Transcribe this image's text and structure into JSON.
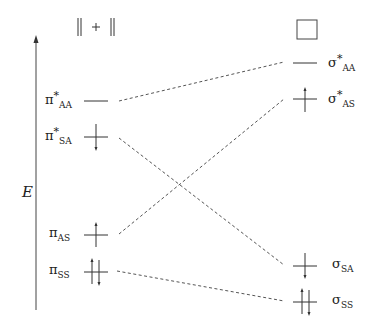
{
  "diagram": {
    "type": "molecular-orbital-correlation-diagram",
    "axis": {
      "label": "E",
      "direction": "up"
    },
    "left_header": {
      "symbol": "∥ + ∥"
    },
    "right_header": {
      "symbol": "□"
    },
    "left_levels": [
      {
        "id": "pi_star_AA",
        "base": "π",
        "star": "*",
        "sub": "AA",
        "electrons": "empty",
        "y": 101
      },
      {
        "id": "pi_star_SA",
        "base": "π",
        "star": "*",
        "sub": "SA",
        "electrons": "down",
        "y": 137
      },
      {
        "id": "pi_AS",
        "base": "π",
        "star": "",
        "sub": "AS",
        "electrons": "up",
        "y": 235
      },
      {
        "id": "pi_SS",
        "base": "π",
        "star": "",
        "sub": "SS",
        "electrons": "up-down",
        "y": 272
      }
    ],
    "right_levels": [
      {
        "id": "sigma_star_AA",
        "base": "σ",
        "star": "*",
        "sub": "AA",
        "electrons": "empty",
        "y": 63
      },
      {
        "id": "sigma_star_AS",
        "base": "σ",
        "star": "*",
        "sub": "AS",
        "electrons": "up",
        "y": 99
      },
      {
        "id": "sigma_SA",
        "base": "σ",
        "star": "",
        "sub": "SA",
        "electrons": "down",
        "y": 266
      },
      {
        "id": "sigma_SS",
        "base": "σ",
        "star": "",
        "sub": "SS",
        "electrons": "up-down",
        "y": 302
      }
    ],
    "correlations": [
      {
        "from": "pi_star_AA",
        "to": "sigma_star_AA"
      },
      {
        "from": "pi_star_SA",
        "to": "sigma_SA"
      },
      {
        "from": "pi_AS",
        "to": "sigma_star_AS"
      },
      {
        "from": "pi_SS",
        "to": "sigma_SS"
      }
    ]
  }
}
